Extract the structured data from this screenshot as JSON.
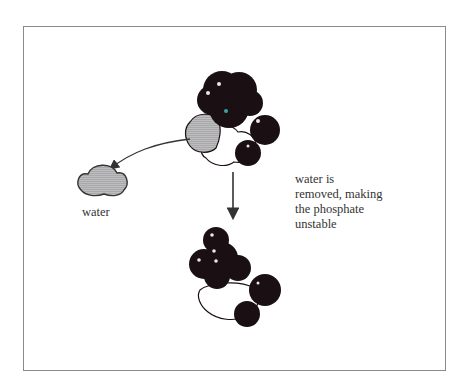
{
  "figure": {
    "water_label": "water",
    "caption_lines": [
      "water is",
      "removed, making",
      "the phosphate",
      "unstable"
    ],
    "colors": {
      "atom_dark": "#1a0f12",
      "water_fill": "#a9a9ab",
      "frame_border": "#8a8a8a",
      "arrow": "#333333",
      "highlight": "#e8e8e8",
      "accent_dot": "#3aa3a8"
    },
    "elements": [
      {
        "name": "phosphate-molecule-with-water",
        "position": "top-center"
      },
      {
        "name": "water-molecule",
        "position": "left"
      },
      {
        "name": "curved-arrow",
        "from": "top-molecule",
        "to": "water-molecule"
      },
      {
        "name": "down-arrow",
        "from": "top-molecule",
        "to": "bottom-molecule"
      },
      {
        "name": "unstable-phosphate-molecule",
        "position": "bottom-center"
      }
    ]
  }
}
